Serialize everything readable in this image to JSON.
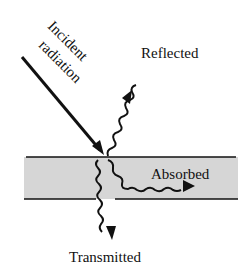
{
  "diagram": {
    "type": "radiation-interaction",
    "labels": {
      "incident_line1": "Incident",
      "incident_line2": "radiation",
      "reflected": "Reflected",
      "absorbed": "Absorbed",
      "transmitted": "Transmitted"
    },
    "colors": {
      "ink": "#111111",
      "slab_fill": "#d6d6d6",
      "background": "#ffffff"
    }
  }
}
